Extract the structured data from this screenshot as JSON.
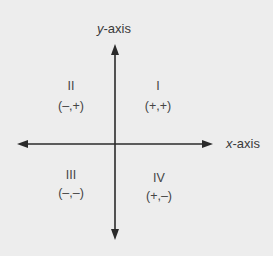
{
  "diagram": {
    "axes": {
      "x": {
        "var": "x",
        "suffix": "-axis"
      },
      "y": {
        "var": "y",
        "suffix": "-axis"
      }
    },
    "quadrants": [
      {
        "numeral": "I",
        "signs": "(+,+)"
      },
      {
        "numeral": "II",
        "signs": "(–,+)"
      },
      {
        "numeral": "III",
        "signs": "(–,–)"
      },
      {
        "numeral": "IV",
        "signs": "(+,–)"
      }
    ],
    "colors": {
      "background": "#ededed",
      "axis": "#2a2a2a",
      "text": "#3a3a3a"
    }
  }
}
